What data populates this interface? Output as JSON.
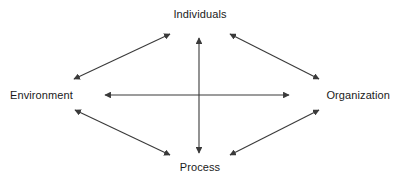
{
  "diagram": {
    "type": "relationship-diagram",
    "title": "",
    "background_color": "#ffffff",
    "line_color": "#3a3a3a",
    "text_color": "#1a1a1a",
    "nodes": [
      {
        "id": "individuals",
        "label": "Individuals",
        "position": "top"
      },
      {
        "id": "environment",
        "label": "Environment",
        "position": "left"
      },
      {
        "id": "organization",
        "label": "Organization",
        "position": "right"
      },
      {
        "id": "process",
        "label": "Process",
        "position": "bottom"
      }
    ],
    "connections": [
      {
        "id": "environment-individuals",
        "from": "Environment",
        "to": "Individuals",
        "arrow": "double"
      },
      {
        "id": "individuals-organization",
        "from": "Individuals",
        "to": "Organization",
        "arrow": "double"
      },
      {
        "id": "environment-process",
        "from": "Environment",
        "to": "Process",
        "arrow": "double"
      },
      {
        "id": "process-organization",
        "from": "Process",
        "to": "Organization",
        "arrow": "double"
      },
      {
        "id": "environment-organization",
        "from": "Environment",
        "to": "Organization",
        "arrow": "double"
      },
      {
        "id": "individuals-process",
        "from": "Individuals",
        "to": "Process",
        "arrow": "double"
      }
    ]
  }
}
